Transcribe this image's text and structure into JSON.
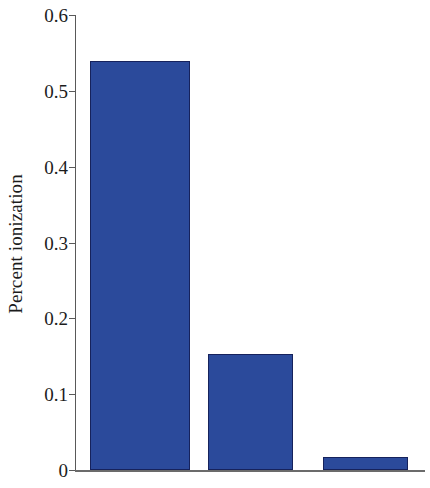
{
  "chart_data": {
    "type": "bar",
    "title": "",
    "subtitle": "",
    "xlabel": "",
    "ylabel": "Percent ionization",
    "categories": [
      "",
      "",
      ""
    ],
    "values": [
      0.54,
      0.153,
      0.017
    ],
    "series": [
      {
        "name": "Percent ionization",
        "values": [
          0.54,
          0.153,
          0.017
        ]
      }
    ],
    "ylim": [
      0,
      0.6
    ],
    "ytick_labels": [
      "0.6",
      "0.5",
      "0.4",
      "0.3",
      "0.2",
      "0.1",
      "0"
    ],
    "ytick_values": [
      0.6,
      0.5,
      0.4,
      0.3,
      0.2,
      0.1,
      0
    ],
    "xtick_labels": [],
    "grid": false,
    "legend": false,
    "legend_position": "none",
    "annotations": [],
    "bar_color": "#2b4a9b",
    "bar_edge_color": "#16225c",
    "axis_color": "#595959",
    "background_color": "#ffffff"
  },
  "axes": {
    "y_title": "Percent ionization"
  }
}
